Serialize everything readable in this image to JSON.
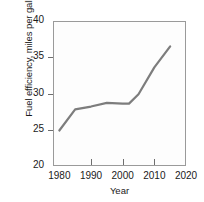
{
  "chart_data": {
    "type": "line",
    "title": "",
    "xlabel": "Year",
    "ylabel": "Fuel efficiency, miles per gallon",
    "xlim": [
      1978,
      2020
    ],
    "ylim": [
      20,
      40
    ],
    "xticks": [
      1980,
      1990,
      2000,
      2010,
      2020
    ],
    "xtick_labels": [
      "1980",
      "1990",
      "2000",
      "2010",
      "2020"
    ],
    "yticks": [
      20,
      25,
      30,
      35,
      40
    ],
    "ytick_labels": [
      "20",
      "25",
      "30",
      "35",
      "40"
    ],
    "grid": false,
    "legend": "none",
    "series": [
      {
        "name": "Fuel efficiency",
        "color": "#7d7d7d",
        "line_width": 2.2,
        "x": [
          1980,
          1985,
          1990,
          1995,
          2000,
          2002,
          2005,
          2010,
          2015
        ],
        "values": [
          24.9,
          27.8,
          28.2,
          28.7,
          28.6,
          28.6,
          29.9,
          33.6,
          36.5
        ]
      }
    ]
  },
  "axes": {
    "y_label_text": "Fuel efficiency, miles per gallon",
    "x_label_text": "Year"
  }
}
